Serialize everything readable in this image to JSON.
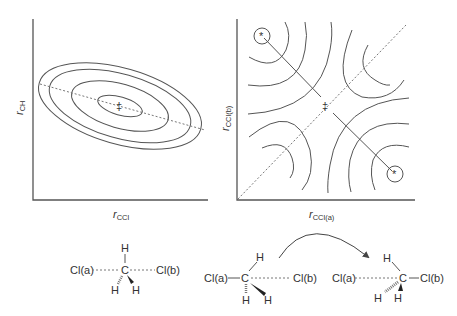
{
  "left_plot": {
    "x_label": "r",
    "x_label_sub": "CCl",
    "y_label": "r",
    "y_label_sub": "CH",
    "saddle_symbol": "‡",
    "contour_count": 4
  },
  "right_plot": {
    "x_label": "r",
    "x_label_sub": "CCl(a)",
    "y_label": "r",
    "y_label_sub": "CCl(b)",
    "saddle_symbol": "‡",
    "minimum_marker": "*"
  },
  "structures": {
    "transition_state": {
      "left_atom": "Cl(a)",
      "right_atom": "Cl(b)",
      "center": "C",
      "h_top": "H",
      "h_bottom_left": "H",
      "h_bottom_right": "H"
    },
    "reactant": {
      "left_atom": "Cl(a)",
      "right_atom": "Cl(b)",
      "center": "C",
      "h_top": "H",
      "h_bottom_left": "H",
      "h_bottom_right": "H"
    },
    "product": {
      "left_atom": "Cl(a)",
      "right_atom": "Cl(b)",
      "center": "C",
      "h_top": "H",
      "h_bottom_left": "H",
      "h_bottom_right": "H"
    }
  }
}
